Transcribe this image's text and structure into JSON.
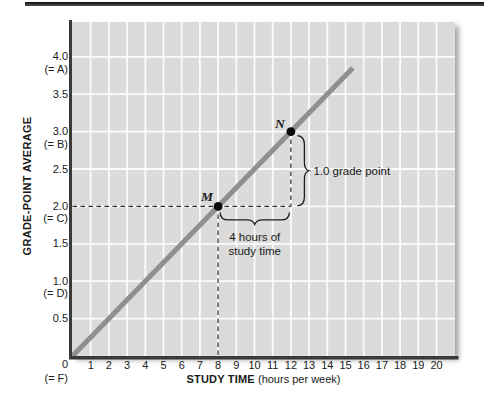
{
  "colors": {
    "plot_background": "#dbdbdb",
    "gridline": "#ffffff",
    "line": "#8f8f8f",
    "axis": "#3a3a3a",
    "point": "#0a0a0a",
    "dashed_guide": "#2d2d2d",
    "text": "#1a1a1a",
    "top_rule": "#1c1c1c"
  },
  "chart_data": {
    "type": "line",
    "title": "",
    "xlabel": "STUDY TIME",
    "xlabel_units": "(hours per week)",
    "ylabel": "GRADE-POINT AVERAGE",
    "xlim": [
      0,
      21
    ],
    "ylim": [
      0,
      4.48
    ],
    "grid": {
      "visible": true,
      "x_step": 1,
      "y_step": 0.5
    },
    "x_ticks": [
      1,
      2,
      3,
      4,
      5,
      6,
      7,
      8,
      9,
      10,
      11,
      12,
      13,
      14,
      15,
      16,
      17,
      18,
      19,
      20
    ],
    "y_ticks": [
      {
        "value": "4.0",
        "grade": "(= A)",
        "v": 4.0
      },
      {
        "value": "3.5",
        "grade": "",
        "v": 3.5
      },
      {
        "value": "3.0",
        "grade": "(= B)",
        "v": 3.0
      },
      {
        "value": "2.5",
        "grade": "",
        "v": 2.5
      },
      {
        "value": "2.0",
        "grade": "(= C)",
        "v": 2.0
      },
      {
        "value": "1.5",
        "grade": "",
        "v": 1.5
      },
      {
        "value": "1.0",
        "grade": "(= D)",
        "v": 1.0
      },
      {
        "value": "0.5",
        "grade": "",
        "v": 0.5
      }
    ],
    "origin_tick": {
      "value": "0",
      "grade": "(= F)",
      "v": 0
    },
    "series": [
      {
        "name": "gpa-vs-study-time",
        "x": [
          0,
          15.4
        ],
        "y": [
          0,
          3.85
        ]
      }
    ],
    "points": [
      {
        "label": "M",
        "x": 8,
        "y": 2.0
      },
      {
        "label": "N",
        "x": 12,
        "y": 3.0
      }
    ],
    "dashed_guides": [
      {
        "from": [
          0,
          2.0
        ],
        "to": [
          12,
          2.0
        ]
      },
      {
        "from": [
          8,
          2.0
        ],
        "to": [
          8,
          0
        ]
      },
      {
        "from": [
          12,
          3.0
        ],
        "to": [
          12,
          2.0
        ]
      }
    ],
    "annotations": {
      "rise": "1.0 grade point",
      "run_line1": "4 hours of",
      "run_line2": "study time"
    }
  }
}
